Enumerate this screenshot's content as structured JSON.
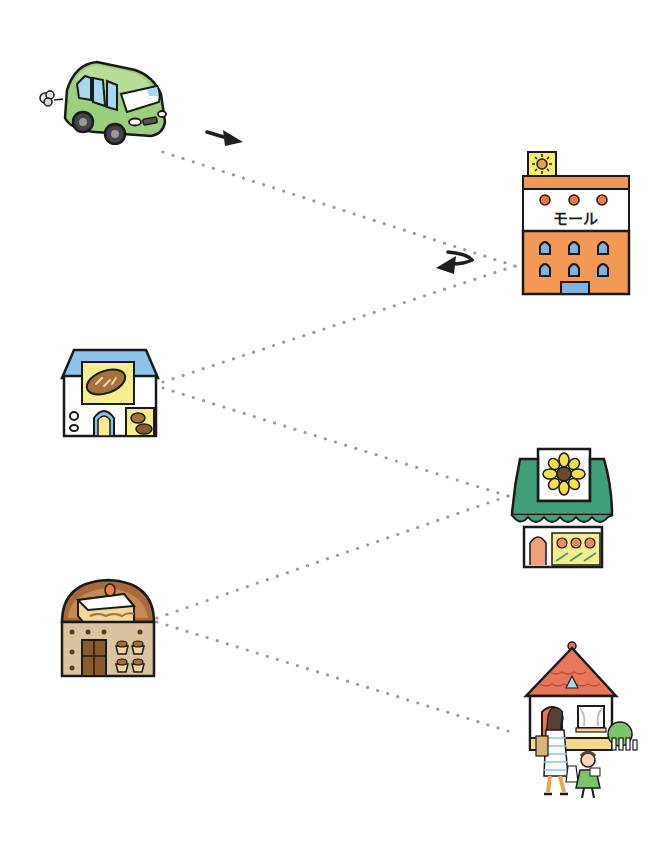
{
  "diagram": {
    "type": "route-map",
    "colors": {
      "background": "#ffffff",
      "path_dot": "#9a9a9a",
      "outline": "#1a1a1a",
      "arrow": "#1f1f1f",
      "car_green": "#9ccf7d",
      "mall_orange": "#f29a55",
      "bakery_blue": "#8ec3ea",
      "flower_green": "#3f9f78",
      "cake_brown": "#a86a3a",
      "house_roof": "#e8765a"
    },
    "nodes": [
      {
        "id": "car",
        "name": "car",
        "icon": "car-icon",
        "x": 35,
        "y": 50,
        "w": 135,
        "h": 95
      },
      {
        "id": "mall",
        "name": "mall",
        "icon": "mall-building-icon",
        "sign_text": "モール",
        "x": 520,
        "y": 150,
        "w": 115,
        "h": 150
      },
      {
        "id": "bakery",
        "name": "bakery",
        "icon": "bakery-icon",
        "x": 60,
        "y": 348,
        "w": 100,
        "h": 92
      },
      {
        "id": "flower_shop",
        "name": "flower shop",
        "icon": "flower-shop-icon",
        "x": 510,
        "y": 447,
        "w": 105,
        "h": 125
      },
      {
        "id": "cake_shop",
        "name": "cake shop",
        "icon": "cake-shop-icon",
        "x": 58,
        "y": 572,
        "w": 100,
        "h": 108
      },
      {
        "id": "home",
        "name": "home",
        "icon": "house-with-family-icon",
        "x": 520,
        "y": 638,
        "w": 120,
        "h": 165
      }
    ],
    "edges": [
      {
        "from": "car",
        "to": "mall",
        "x1": 163,
        "y1": 152,
        "x2": 515,
        "y2": 266
      },
      {
        "from": "mall",
        "to": "bakery",
        "x1": 515,
        "y1": 266,
        "x2": 163,
        "y2": 382
      },
      {
        "from": "bakery",
        "to": "flower_shop",
        "x1": 163,
        "y1": 388,
        "x2": 508,
        "y2": 496
      },
      {
        "from": "flower_shop",
        "to": "cake_shop",
        "x1": 508,
        "y1": 496,
        "x2": 157,
        "y2": 618
      },
      {
        "from": "cake_shop",
        "to": "home",
        "x1": 157,
        "y1": 622,
        "x2": 508,
        "y2": 731
      }
    ],
    "arrows": [
      {
        "name": "direction-arrow-right",
        "x": 207,
        "y": 130,
        "direction": "down-right"
      },
      {
        "name": "direction-arrow-uturn",
        "x": 436,
        "y": 250,
        "direction": "u-turn-left"
      }
    ]
  }
}
